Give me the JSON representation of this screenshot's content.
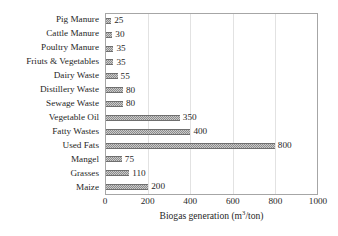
{
  "chart_data": {
    "type": "bar",
    "orientation": "horizontal",
    "title": "",
    "xlabel": "Biogas generation (m³/ton)",
    "ylabel": "",
    "xlim": [
      0,
      1000
    ],
    "xticks": [
      0,
      200,
      400,
      600,
      800,
      1000
    ],
    "xtick_labels": [
      "0",
      "200",
      "400",
      "600",
      "800",
      "1000"
    ],
    "grid": true,
    "grid_axis": "x",
    "legend": false,
    "data_labels": true,
    "bar_color": "#8c8c8c",
    "bar_pattern": "fine-checker",
    "frame_color": "#a6a6a6",
    "categories": [
      "Pig Manure",
      "Cattle Manure",
      "Poultry Manure",
      "Friuts & Vegetables",
      "Dairy Waste",
      "Distillery Waste",
      "Sewage Waste",
      "Vegetable Oil",
      "Fatty Wastes",
      "Used Fats",
      "Mangel",
      "Grasses",
      "Maize"
    ],
    "values": [
      25,
      30,
      35,
      35,
      55,
      80,
      80,
      350,
      400,
      800,
      75,
      110,
      200
    ],
    "value_labels": [
      "25",
      "30",
      "35",
      "35",
      "55",
      "80",
      "80",
      "350",
      "400",
      "800",
      "75",
      "110",
      "200"
    ]
  },
  "axis": {
    "x_title_main": "Biogas generation (m",
    "x_title_sup": "3",
    "x_title_tail": "/ton)"
  }
}
